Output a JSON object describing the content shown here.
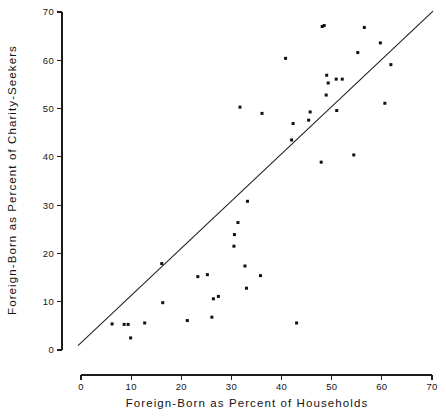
{
  "chart_data": {
    "type": "scatter",
    "title": "",
    "xlabel": "Foreign-Born as Percent of Households",
    "ylabel": "Foreign-Born as Percent of Charity-Seekers",
    "xlim": [
      0,
      70
    ],
    "ylim": [
      0,
      70
    ],
    "xticks": [
      0,
      10,
      20,
      30,
      40,
      50,
      60,
      70
    ],
    "yticks": [
      0,
      10,
      20,
      30,
      40,
      50,
      60,
      70
    ],
    "xticklabels": [
      "0",
      "10",
      "20",
      "30",
      "40",
      "50",
      "60",
      "70"
    ],
    "yticklabels": [
      "0",
      "10",
      "20",
      "30",
      "40",
      "50",
      "60",
      "70"
    ],
    "grid": false,
    "legend": null,
    "marker": "square",
    "marker_color": "#101010",
    "line_color": "#1d1d1d",
    "reference_line": {
      "label": "45-degree reference line",
      "x0": -0.6,
      "y0": 0.9,
      "x1": 70.2,
      "y1": 70.2
    },
    "points": [
      {
        "x": 6.2,
        "y": 5.4
      },
      {
        "x": 8.6,
        "y": 5.3
      },
      {
        "x": 9.4,
        "y": 5.3
      },
      {
        "x": 9.9,
        "y": 2.5
      },
      {
        "x": 12.7,
        "y": 5.6
      },
      {
        "x": 16.1,
        "y": 17.9
      },
      {
        "x": 16.3,
        "y": 9.8
      },
      {
        "x": 21.2,
        "y": 6.1
      },
      {
        "x": 23.3,
        "y": 15.2
      },
      {
        "x": 25.2,
        "y": 15.6
      },
      {
        "x": 26.1,
        "y": 6.8
      },
      {
        "x": 26.4,
        "y": 10.6
      },
      {
        "x": 27.4,
        "y": 11.1
      },
      {
        "x": 30.5,
        "y": 21.5
      },
      {
        "x": 30.6,
        "y": 23.9
      },
      {
        "x": 31.3,
        "y": 26.4
      },
      {
        "x": 31.7,
        "y": 50.3
      },
      {
        "x": 32.7,
        "y": 17.4
      },
      {
        "x": 33.0,
        "y": 12.8
      },
      {
        "x": 33.2,
        "y": 30.8
      },
      {
        "x": 35.8,
        "y": 15.4
      },
      {
        "x": 36.1,
        "y": 49.0
      },
      {
        "x": 40.8,
        "y": 60.4
      },
      {
        "x": 42.0,
        "y": 43.5
      },
      {
        "x": 42.3,
        "y": 46.9
      },
      {
        "x": 43.0,
        "y": 5.6
      },
      {
        "x": 45.4,
        "y": 47.6
      },
      {
        "x": 45.7,
        "y": 49.3
      },
      {
        "x": 47.9,
        "y": 38.9
      },
      {
        "x": 48.1,
        "y": 67.0
      },
      {
        "x": 48.5,
        "y": 67.2
      },
      {
        "x": 48.9,
        "y": 52.8
      },
      {
        "x": 49.0,
        "y": 56.9
      },
      {
        "x": 49.3,
        "y": 55.3
      },
      {
        "x": 50.9,
        "y": 56.1
      },
      {
        "x": 51.0,
        "y": 49.6
      },
      {
        "x": 52.1,
        "y": 56.1
      },
      {
        "x": 54.4,
        "y": 40.4
      },
      {
        "x": 55.2,
        "y": 61.6
      },
      {
        "x": 56.5,
        "y": 66.8
      },
      {
        "x": 59.7,
        "y": 63.6
      },
      {
        "x": 60.6,
        "y": 51.1
      },
      {
        "x": 61.8,
        "y": 59.1
      }
    ]
  }
}
